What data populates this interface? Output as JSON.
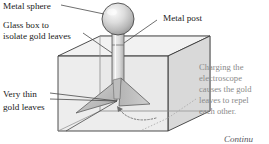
{
  "figure": {
    "background": "#ffffff"
  },
  "labels": {
    "metal_sphere": "Metal sphere",
    "glass_box_line1": "Glass box to",
    "glass_box_line2": "isolate gold leaves",
    "metal_post": "Metal post",
    "gold_leaves_line1": "Very thin",
    "gold_leaves_line2": "gold leaves",
    "caption_line1": "Charging the",
    "caption_line2": "electroscope",
    "caption_line3": "causes the gold",
    "caption_line4": "leaves to repel",
    "caption_line5": "each other.",
    "continued": "Continu"
  },
  "colors": {
    "label_dark": "#1a1a1a",
    "label_gray": "#8a8a8a",
    "leader_line": "#4a4a4a",
    "caption_leader": "#9a9a9a",
    "box_outline": "#3a3a3a",
    "box_face_front": "#e4e4e4",
    "box_face_top": "#f2f2f2",
    "box_face_right": "#d6d6d6",
    "sphere_light": "#f4f4f4",
    "sphere_mid": "#d0d0d0",
    "sphere_dark": "#9a9a9a",
    "post_light": "#ededed",
    "post_dark": "#b4b4b4",
    "leaf_light": "#c9c9c9",
    "leaf_dark": "#a6a6a6",
    "arc_dotted": "#7a7a7a"
  },
  "geometry": {
    "sphere": {
      "cx": 118,
      "cy": 19,
      "r": 16
    },
    "post": {
      "x": 112,
      "y_top": 33,
      "width": 12,
      "y_bottom": 97
    },
    "box": {
      "front_topleft": [
        58,
        56
      ],
      "front_bottomright": [
        168,
        131
      ],
      "depth_dx": 42,
      "depth_dy": -20
    },
    "leaves": {
      "pivot": [
        117,
        97
      ],
      "left_tip": [
        76,
        113
      ],
      "right_tip": [
        150,
        104
      ]
    },
    "repel_arc": {
      "from": [
        118,
        112
      ],
      "to": [
        145,
        118
      ]
    }
  },
  "icons": {
    "sphere": "sphere-shape",
    "post": "cylinder-shape",
    "box": "transparent-box-shape",
    "leaves": "gold-leaf-shape",
    "arc": "repulsion-arrow-icon"
  }
}
